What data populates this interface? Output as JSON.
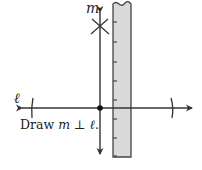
{
  "diagram": {
    "line_m_label": "m",
    "line_l_label": "ℓ",
    "caption": {
      "prefix": "Draw ",
      "var1": "m",
      "symbol": " ⊥ ",
      "var2": "ℓ",
      "suffix": "."
    },
    "colors": {
      "line": "#333333",
      "ruler_fill": "#d9d9d9",
      "ruler_edge": "#444444"
    },
    "ruler_ticks_y": [
      22,
      42,
      62,
      81,
      100,
      119,
      138,
      156
    ]
  }
}
